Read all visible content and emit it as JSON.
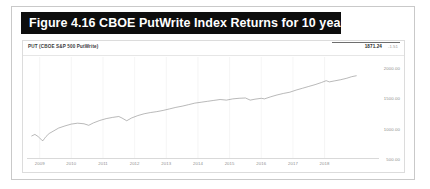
{
  "figure": {
    "caption": "Figure 4.16 CBOE PutWrite Index Returns for 10 years"
  },
  "chart_panel": {
    "series_label": "PUT (CBOE S&P 500 PutWrite)",
    "last_value": "1871.24",
    "change_label": "-1.51"
  },
  "colors": {
    "caption_bar": "#0d0d0d",
    "caption_text": "#ffffff",
    "line": "#8a8a8a",
    "grid": "#f0f0f0",
    "axis_text": "#8f8f8f",
    "frame": "#c9c9c9"
  },
  "chart_data": {
    "type": "line",
    "title": "CBOE PutWrite Index Returns for 10 years",
    "subtitle": "PUT (CBOE S&P 500 PutWrite)",
    "xlabel": "",
    "ylabel": "",
    "grid": true,
    "legend_position": "top-left",
    "series": [
      {
        "name": "PUT (CBOE S&P 500 PutWrite)",
        "x": [
          2008.75,
          2008.85,
          2008.95,
          2009.0,
          2009.05,
          2009.1,
          2009.15,
          2009.2,
          2009.3,
          2009.45,
          2009.6,
          2009.8,
          2010.0,
          2010.2,
          2010.4,
          2010.55,
          2010.7,
          2010.9,
          2011.1,
          2011.3,
          2011.5,
          2011.6,
          2011.75,
          2011.9,
          2012.1,
          2012.3,
          2012.5,
          2012.7,
          2012.9,
          2013.1,
          2013.3,
          2013.5,
          2013.7,
          2013.9,
          2014.1,
          2014.3,
          2014.5,
          2014.7,
          2014.9,
          2015.1,
          2015.3,
          2015.5,
          2015.65,
          2015.8,
          2016.0,
          2016.1,
          2016.3,
          2016.5,
          2016.7,
          2016.9,
          2017.1,
          2017.3,
          2017.5,
          2017.7,
          2017.9,
          2018.05,
          2018.15,
          2018.3,
          2018.5,
          2018.7,
          2018.85,
          2019.0
        ],
        "y": [
          880,
          905,
          870,
          845,
          820,
          800,
          835,
          870,
          920,
          965,
          1010,
          1045,
          1075,
          1090,
          1080,
          1055,
          1095,
          1135,
          1165,
          1185,
          1200,
          1175,
          1130,
          1175,
          1215,
          1245,
          1265,
          1280,
          1300,
          1325,
          1350,
          1370,
          1395,
          1420,
          1435,
          1450,
          1465,
          1480,
          1470,
          1490,
          1500,
          1505,
          1470,
          1485,
          1500,
          1490,
          1525,
          1555,
          1580,
          1600,
          1635,
          1665,
          1695,
          1725,
          1760,
          1790,
          1770,
          1785,
          1805,
          1830,
          1855,
          1871
        ]
      }
    ],
    "x_ticks": [
      "2009",
      "2010",
      "2011",
      "2012",
      "2013",
      "2014",
      "2015",
      "2016",
      "2017",
      "2018"
    ],
    "y_ticks": [
      "2000.00",
      "1500.00",
      "1000.00",
      "500.00"
    ],
    "xlim": [
      2008.6,
      2019.15
    ],
    "ylim": [
      500,
      2180
    ],
    "last_value": 1871.24
  }
}
